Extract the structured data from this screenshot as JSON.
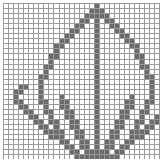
{
  "pattern": {
    "title": "Leaf Cross Stitch Chart",
    "type": "grid-chart",
    "columns": 37,
    "rows": 36,
    "cell_size_px": 4,
    "colors": {
      "background": "#ffffff",
      "grid_line": "#9a9a9a",
      "filled_cell": "#6b6b6b"
    },
    "symbol_legend": {
      "filled": "stitch",
      "empty": "blank"
    },
    "motif": "leaf",
    "filled_cells": [
      [
        0,
        18
      ],
      [
        1,
        17
      ],
      [
        1,
        18
      ],
      [
        1,
        19
      ],
      [
        2,
        16
      ],
      [
        2,
        17
      ],
      [
        2,
        18
      ],
      [
        2,
        19
      ],
      [
        2,
        20
      ],
      [
        3,
        15
      ],
      [
        3,
        16
      ],
      [
        3,
        18
      ],
      [
        3,
        20
      ],
      [
        3,
        21
      ],
      [
        4,
        14
      ],
      [
        4,
        15
      ],
      [
        4,
        18
      ],
      [
        4,
        21
      ],
      [
        4,
        22
      ],
      [
        5,
        13
      ],
      [
        5,
        14
      ],
      [
        5,
        18
      ],
      [
        5,
        22
      ],
      [
        5,
        23
      ],
      [
        6,
        12
      ],
      [
        6,
        13
      ],
      [
        6,
        18
      ],
      [
        6,
        23
      ],
      [
        6,
        24
      ],
      [
        7,
        11
      ],
      [
        7,
        12
      ],
      [
        7,
        18
      ],
      [
        7,
        24
      ],
      [
        7,
        25
      ],
      [
        8,
        10
      ],
      [
        8,
        11
      ],
      [
        8,
        18
      ],
      [
        8,
        25
      ],
      [
        8,
        26
      ],
      [
        9,
        10
      ],
      [
        9,
        18
      ],
      [
        9,
        26
      ],
      [
        10,
        9
      ],
      [
        10,
        10
      ],
      [
        10,
        18
      ],
      [
        10,
        26
      ],
      [
        10,
        27
      ],
      [
        11,
        9
      ],
      [
        11,
        18
      ],
      [
        11,
        27
      ],
      [
        12,
        8
      ],
      [
        12,
        9
      ],
      [
        12,
        18
      ],
      [
        12,
        27
      ],
      [
        12,
        28
      ],
      [
        13,
        8
      ],
      [
        13,
        18
      ],
      [
        13,
        28
      ],
      [
        14,
        7
      ],
      [
        14,
        8
      ],
      [
        14,
        18
      ],
      [
        14,
        28
      ],
      [
        14,
        29
      ],
      [
        15,
        7
      ],
      [
        15,
        18
      ],
      [
        15,
        29
      ],
      [
        16,
        3
      ],
      [
        16,
        4
      ],
      [
        16,
        7
      ],
      [
        16,
        18
      ],
      [
        16,
        29
      ],
      [
        16,
        32
      ],
      [
        16,
        33
      ],
      [
        17,
        2
      ],
      [
        17,
        3
      ],
      [
        17,
        7
      ],
      [
        17,
        18
      ],
      [
        17,
        29
      ],
      [
        17,
        33
      ],
      [
        17,
        34
      ],
      [
        18,
        2
      ],
      [
        18,
        7
      ],
      [
        18,
        11
      ],
      [
        18,
        18
      ],
      [
        18,
        25
      ],
      [
        18,
        29
      ],
      [
        18,
        34
      ],
      [
        19,
        2
      ],
      [
        19,
        3
      ],
      [
        19,
        7
      ],
      [
        19,
        8
      ],
      [
        19,
        11
      ],
      [
        19,
        12
      ],
      [
        19,
        18
      ],
      [
        19,
        24
      ],
      [
        19,
        25
      ],
      [
        19,
        28
      ],
      [
        19,
        29
      ],
      [
        19,
        33
      ],
      [
        19,
        34
      ],
      [
        20,
        3
      ],
      [
        20,
        4
      ],
      [
        20,
        8
      ],
      [
        20,
        11
      ],
      [
        20,
        12
      ],
      [
        20,
        18
      ],
      [
        20,
        24
      ],
      [
        20,
        25
      ],
      [
        20,
        28
      ],
      [
        20,
        32
      ],
      [
        20,
        33
      ],
      [
        21,
        4
      ],
      [
        21,
        5
      ],
      [
        21,
        8
      ],
      [
        21,
        9
      ],
      [
        21,
        12
      ],
      [
        21,
        13
      ],
      [
        21,
        18
      ],
      [
        21,
        23
      ],
      [
        21,
        24
      ],
      [
        21,
        27
      ],
      [
        21,
        28
      ],
      [
        21,
        31
      ],
      [
        21,
        32
      ],
      [
        22,
        5
      ],
      [
        22,
        6
      ],
      [
        22,
        9
      ],
      [
        22,
        12
      ],
      [
        22,
        13
      ],
      [
        22,
        18
      ],
      [
        22,
        23
      ],
      [
        22,
        24
      ],
      [
        22,
        27
      ],
      [
        22,
        30
      ],
      [
        22,
        31
      ],
      [
        23,
        6
      ],
      [
        23,
        7
      ],
      [
        23,
        9
      ],
      [
        23,
        10
      ],
      [
        23,
        13
      ],
      [
        23,
        14
      ],
      [
        23,
        18
      ],
      [
        23,
        22
      ],
      [
        23,
        23
      ],
      [
        23,
        26
      ],
      [
        23,
        27
      ],
      [
        23,
        29
      ],
      [
        23,
        30
      ],
      [
        24,
        7
      ],
      [
        24,
        8
      ],
      [
        24,
        10
      ],
      [
        24,
        13
      ],
      [
        24,
        14
      ],
      [
        24,
        18
      ],
      [
        24,
        22
      ],
      [
        24,
        23
      ],
      [
        24,
        26
      ],
      [
        24,
        28
      ],
      [
        24,
        29
      ],
      [
        25,
        8
      ],
      [
        25,
        9
      ],
      [
        25,
        10
      ],
      [
        25,
        11
      ],
      [
        25,
        14
      ],
      [
        25,
        15
      ],
      [
        25,
        18
      ],
      [
        25,
        21
      ],
      [
        25,
        22
      ],
      [
        25,
        25
      ],
      [
        25,
        26
      ],
      [
        25,
        27
      ],
      [
        25,
        28
      ],
      [
        26,
        9
      ],
      [
        26,
        10
      ],
      [
        26,
        11
      ],
      [
        26,
        14
      ],
      [
        26,
        15
      ],
      [
        26,
        18
      ],
      [
        26,
        21
      ],
      [
        26,
        22
      ],
      [
        26,
        25
      ],
      [
        26,
        26
      ],
      [
        26,
        27
      ],
      [
        27,
        11
      ],
      [
        27,
        12
      ],
      [
        27,
        15
      ],
      [
        27,
        16
      ],
      [
        27,
        18
      ],
      [
        27,
        20
      ],
      [
        27,
        21
      ],
      [
        27,
        24
      ],
      [
        27,
        25
      ],
      [
        28,
        12
      ],
      [
        28,
        13
      ],
      [
        28,
        15
      ],
      [
        28,
        16
      ],
      [
        28,
        18
      ],
      [
        28,
        20
      ],
      [
        28,
        21
      ],
      [
        28,
        23
      ],
      [
        28,
        24
      ],
      [
        29,
        13
      ],
      [
        29,
        14
      ],
      [
        29,
        16
      ],
      [
        29,
        17
      ],
      [
        29,
        18
      ],
      [
        29,
        19
      ],
      [
        29,
        20
      ],
      [
        29,
        22
      ],
      [
        29,
        23
      ],
      [
        30,
        14
      ],
      [
        30,
        15
      ],
      [
        30,
        16
      ],
      [
        30,
        17
      ],
      [
        30,
        18
      ],
      [
        30,
        19
      ],
      [
        30,
        20
      ],
      [
        30,
        21
      ],
      [
        30,
        22
      ],
      [
        31,
        16
      ],
      [
        31,
        17
      ],
      [
        31,
        18
      ],
      [
        31,
        19
      ],
      [
        31,
        20
      ],
      [
        32,
        17
      ],
      [
        32,
        18
      ],
      [
        32,
        19
      ],
      [
        33,
        17
      ],
      [
        33,
        18
      ],
      [
        33,
        19
      ],
      [
        34,
        17
      ],
      [
        34,
        18
      ],
      [
        34,
        19
      ],
      [
        35,
        17
      ],
      [
        35,
        18
      ],
      [
        35,
        19
      ]
    ]
  }
}
